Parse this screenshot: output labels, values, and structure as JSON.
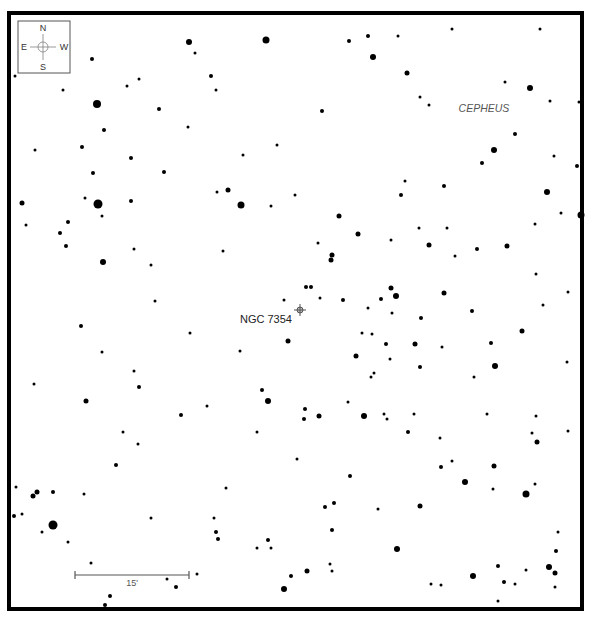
{
  "chart": {
    "width": 592,
    "height": 624,
    "frame": {
      "x": 9,
      "y": 13,
      "width": 573,
      "height": 596,
      "stroke": 4,
      "color": "#000000"
    },
    "star_color": "#000000"
  },
  "compass": {
    "box": {
      "x": 18,
      "y": 21,
      "width": 52,
      "height": 52
    },
    "center": {
      "x": 43,
      "y": 47
    },
    "north": "N",
    "south": "S",
    "east": "E",
    "west": "W",
    "color": "#808080",
    "text_color": "#333333"
  },
  "labels": {
    "constellation": {
      "text": "CEPHEUS",
      "x": 484,
      "y": 112
    },
    "object": {
      "text": "NGC 7354",
      "x": 240,
      "y": 323
    }
  },
  "target_marker": {
    "name": "NGC 7354",
    "x": 300,
    "y": 310,
    "color": "#555555",
    "fill": "#bbbbbb"
  },
  "scale_bar": {
    "x1": 75,
    "x2": 189,
    "y": 575,
    "label": "15'",
    "label_x": 132,
    "label_y": 586,
    "color": "#555555"
  },
  "stars": [
    [
      189,
      42,
      3
    ],
    [
      195,
      53,
      1.5
    ],
    [
      266,
      40,
      3.5
    ],
    [
      92,
      59,
      2
    ],
    [
      15,
      76,
      1.5
    ],
    [
      63,
      90,
      1.5
    ],
    [
      127,
      86,
      1.5
    ],
    [
      139,
      79,
      1.5
    ],
    [
      211,
      76,
      2
    ],
    [
      216,
      90,
      1.5
    ],
    [
      97,
      104,
      4
    ],
    [
      159,
      109,
      2
    ],
    [
      104,
      130,
      2
    ],
    [
      188,
      127,
      1.5
    ],
    [
      82,
      147,
      2
    ],
    [
      35,
      150,
      1.5
    ],
    [
      131,
      158,
      2
    ],
    [
      93,
      173,
      2
    ],
    [
      164,
      172,
      2
    ],
    [
      243,
      155,
      1.5
    ],
    [
      277,
      145,
      1.5
    ],
    [
      228,
      190,
      2.5
    ],
    [
      217,
      192,
      1.5
    ],
    [
      241,
      205,
      3.5
    ],
    [
      22,
      203,
      2.5
    ],
    [
      85,
      198,
      1.5
    ],
    [
      98,
      204,
      4.5
    ],
    [
      131,
      201,
      2
    ],
    [
      271,
      206,
      1.5
    ],
    [
      295,
      195,
      1.5
    ],
    [
      349,
      41,
      2
    ],
    [
      368,
      36,
      2
    ],
    [
      398,
      36,
      1.5
    ],
    [
      452,
      29,
      1.5
    ],
    [
      540,
      29,
      1.5
    ],
    [
      373,
      57,
      3
    ],
    [
      407,
      73,
      2.5
    ],
    [
      505,
      82,
      1.5
    ],
    [
      530,
      88,
      3
    ],
    [
      550,
      101,
      1.5
    ],
    [
      579,
      102,
      1.5
    ],
    [
      420,
      97,
      1.5
    ],
    [
      429,
      105,
      1.5
    ],
    [
      322,
      111,
      2
    ],
    [
      515,
      134,
      2
    ],
    [
      494,
      150,
      3
    ],
    [
      482,
      163,
      2
    ],
    [
      554,
      156,
      1.5
    ],
    [
      577,
      166,
      2
    ],
    [
      405,
      181,
      1.5
    ],
    [
      444,
      186,
      2
    ],
    [
      401,
      195,
      2
    ],
    [
      547,
      192,
      3
    ],
    [
      102,
      216,
      1.5
    ],
    [
      26,
      225,
      1.5
    ],
    [
      68,
      222,
      2
    ],
    [
      60,
      233,
      2
    ],
    [
      66,
      246,
      2
    ],
    [
      134,
      249,
      1.5
    ],
    [
      103,
      262,
      3
    ],
    [
      151,
      265,
      1.5
    ],
    [
      223,
      251,
      1.5
    ],
    [
      155,
      301,
      1.5
    ],
    [
      284,
      300,
      1.5
    ],
    [
      81,
      326,
      2
    ],
    [
      190,
      333,
      1.5
    ],
    [
      288,
      341,
      2.5
    ],
    [
      102,
      352,
      1.5
    ],
    [
      240,
      351,
      1.5
    ],
    [
      34,
      384,
      1.5
    ],
    [
      134,
      371,
      1.5
    ],
    [
      139,
      387,
      2
    ],
    [
      262,
      390,
      2
    ],
    [
      86,
      401,
      2.5
    ],
    [
      207,
      406,
      1.5
    ],
    [
      268,
      401,
      3
    ],
    [
      339,
      216,
      2.5
    ],
    [
      358,
      234,
      2.5
    ],
    [
      318,
      243,
      1.5
    ],
    [
      332,
      255,
      2.5
    ],
    [
      331,
      260,
      2.5
    ],
    [
      419,
      228,
      1.5
    ],
    [
      429,
      245,
      2.5
    ],
    [
      391,
      240,
      1.5
    ],
    [
      447,
      228,
      1.5
    ],
    [
      455,
      256,
      1.5
    ],
    [
      477,
      249,
      2
    ],
    [
      507,
      246,
      2.5
    ],
    [
      535,
      224,
      1.5
    ],
    [
      561,
      213,
      1.5
    ],
    [
      581,
      215,
      3.5
    ],
    [
      306,
      287,
      2
    ],
    [
      311,
      287,
      2
    ],
    [
      320,
      298,
      1.5
    ],
    [
      343,
      300,
      2
    ],
    [
      381,
      299,
      2
    ],
    [
      391,
      288,
      2.5
    ],
    [
      396,
      296,
      3
    ],
    [
      368,
      308,
      1.5
    ],
    [
      444,
      293,
      2.5
    ],
    [
      536,
      274,
      1.5
    ],
    [
      568,
      292,
      1.5
    ],
    [
      543,
      305,
      1.5
    ],
    [
      472,
      311,
      2
    ],
    [
      421,
      318,
      2
    ],
    [
      392,
      313,
      1.5
    ],
    [
      415,
      344,
      2.5
    ],
    [
      372,
      334,
      1.5
    ],
    [
      386,
      344,
      2
    ],
    [
      362,
      333,
      1.5
    ],
    [
      442,
      347,
      1.5
    ],
    [
      491,
      343,
      2
    ],
    [
      390,
      359,
      1.5
    ],
    [
      356,
      356,
      2.5
    ],
    [
      495,
      366,
      3
    ],
    [
      474,
      377,
      1.5
    ],
    [
      420,
      367,
      2
    ],
    [
      371,
      377,
      1.5
    ],
    [
      374,
      373,
      1.5
    ],
    [
      567,
      362,
      1.5
    ],
    [
      522,
      331,
      2.5
    ],
    [
      348,
      402,
      1.5
    ],
    [
      181,
      415,
      2
    ],
    [
      123,
      432,
      1.5
    ],
    [
      138,
      444,
      1.5
    ],
    [
      116,
      465,
      2
    ],
    [
      257,
      432,
      1.5
    ],
    [
      297,
      459,
      1.5
    ],
    [
      16,
      487,
      1.5
    ],
    [
      37,
      492,
      2.5
    ],
    [
      33,
      496,
      2.5
    ],
    [
      53,
      492,
      2
    ],
    [
      84,
      494,
      1.5
    ],
    [
      14,
      516,
      2
    ],
    [
      22,
      514,
      1.5
    ],
    [
      53,
      525,
      4.5
    ],
    [
      42,
      532,
      1.5
    ],
    [
      68,
      542,
      1.5
    ],
    [
      151,
      518,
      1.5
    ],
    [
      214,
      518,
      1.5
    ],
    [
      226,
      488,
      1.5
    ],
    [
      216,
      532,
      2
    ],
    [
      218,
      539,
      2
    ],
    [
      91,
      563,
      1.5
    ],
    [
      167,
      579,
      1.5
    ],
    [
      176,
      587,
      2
    ],
    [
      197,
      574,
      1.5
    ],
    [
      257,
      548,
      1.5
    ],
    [
      271,
      548,
      1.5
    ],
    [
      284,
      589,
      3
    ],
    [
      291,
      576,
      2
    ],
    [
      268,
      540,
      2
    ],
    [
      110,
      596,
      2
    ],
    [
      105,
      605,
      2
    ],
    [
      305,
      409,
      2
    ],
    [
      304,
      419,
      2
    ],
    [
      319,
      416,
      2.5
    ],
    [
      364,
      416,
      3
    ],
    [
      384,
      414,
      1.5
    ],
    [
      387,
      419,
      1.5
    ],
    [
      414,
      414,
      1.5
    ],
    [
      408,
      432,
      2
    ],
    [
      440,
      438,
      1.5
    ],
    [
      487,
      414,
      1.5
    ],
    [
      536,
      416,
      1.5
    ],
    [
      532,
      433,
      1.5
    ],
    [
      537,
      442,
      2.5
    ],
    [
      568,
      431,
      1.5
    ],
    [
      350,
      476,
      2
    ],
    [
      441,
      467,
      2
    ],
    [
      452,
      461,
      1.5
    ],
    [
      494,
      466,
      2.5
    ],
    [
      465,
      482,
      3
    ],
    [
      493,
      489,
      1.5
    ],
    [
      535,
      484,
      1.5
    ],
    [
      526,
      494,
      3.5
    ],
    [
      325,
      507,
      2
    ],
    [
      334,
      503,
      2
    ],
    [
      378,
      509,
      1.5
    ],
    [
      420,
      506,
      2.5
    ],
    [
      332,
      530,
      2
    ],
    [
      397,
      549,
      3
    ],
    [
      307,
      571,
      2.5
    ],
    [
      330,
      564,
      1.5
    ],
    [
      332,
      571,
      1.5
    ],
    [
      431,
      584,
      1.5
    ],
    [
      441,
      585,
      1.5
    ],
    [
      473,
      576,
      3
    ],
    [
      498,
      566,
      2
    ],
    [
      504,
      582,
      2
    ],
    [
      515,
      584,
      1.5
    ],
    [
      526,
      570,
      1.5
    ],
    [
      549,
      567,
      3
    ],
    [
      555,
      573,
      2.5
    ],
    [
      556,
      551,
      2
    ],
    [
      558,
      532,
      1.5
    ],
    [
      555,
      587,
      1.5
    ],
    [
      498,
      601,
      1.5
    ],
    [
      582,
      582,
      1.5
    ]
  ]
}
